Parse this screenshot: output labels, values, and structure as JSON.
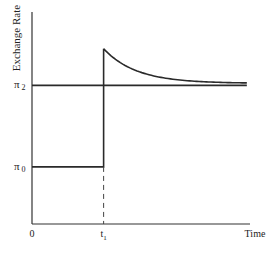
{
  "chart_data": {
    "type": "line",
    "title": "",
    "xlabel": "Time",
    "ylabel": "Exchange Rate",
    "x_ticks": [
      {
        "label": "0",
        "value": 0
      },
      {
        "label": "t1",
        "value": 1
      }
    ],
    "y_ticks": [
      {
        "label": "π2",
        "value": 2
      },
      {
        "label": "π0",
        "value": 0
      }
    ],
    "xlim": [
      0,
      3.1
    ],
    "ylim": [
      -1.4,
      3.8
    ],
    "grid": false,
    "legend": "none",
    "series": [
      {
        "name": "exchange-rate-path",
        "segments": [
          {
            "kind": "flat",
            "x": [
              0,
              1
            ],
            "y": 0
          },
          {
            "kind": "jump",
            "x": 1,
            "y": [
              0,
              2.9
            ]
          },
          {
            "kind": "exponential-decay",
            "x": [
              1,
              3
            ],
            "start": 2.9,
            "asymptote": 2.05,
            "rate": 2.2
          }
        ]
      },
      {
        "name": "new-level-pi2",
        "segments": [
          {
            "kind": "flat",
            "x": [
              0,
              3
            ],
            "y": 2
          }
        ]
      }
    ],
    "annotations": [
      {
        "kind": "dashed-vertical",
        "x": 1,
        "y_from": -1.4,
        "y_to": 0
      }
    ]
  }
}
